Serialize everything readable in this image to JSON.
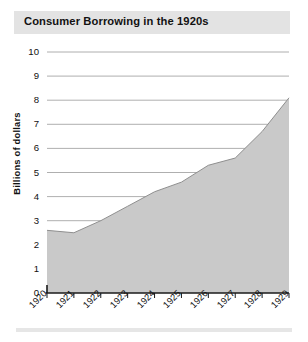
{
  "figure": {
    "title": "Consumer Borrowing in the 1920s",
    "bottom_rule": "",
    "colors": {
      "title_band": "#e3e3e3",
      "area_fill": "#c9c9c9",
      "area_line": "#8f8f8f",
      "gridline": "#9a9a9a",
      "axis": "#1a1a1a",
      "text": "#111111",
      "bottom_rule": "#e6e6e6"
    }
  },
  "chart_data": {
    "type": "area",
    "title": "Consumer Borrowing in the 1920s",
    "xlabel": "",
    "ylabel": "Billions of dollars",
    "categories": [
      "1920",
      "1921",
      "1922",
      "1923",
      "1924",
      "1925",
      "1926",
      "1927",
      "1928",
      "1929"
    ],
    "x": [
      1920,
      1921,
      1922,
      1923,
      1924,
      1925,
      1926,
      1927,
      1928,
      1929
    ],
    "values": [
      2.6,
      2.5,
      3.0,
      3.6,
      4.2,
      4.6,
      5.3,
      5.6,
      6.7,
      8.1
    ],
    "ylim": [
      0,
      10
    ],
    "xlim": [
      1920,
      1929
    ],
    "yticks": [
      0,
      1,
      2,
      3,
      4,
      5,
      6,
      7,
      8,
      9,
      10
    ],
    "ytick_labels": [
      "0",
      "1",
      "2",
      "3",
      "4",
      "5",
      "6",
      "7",
      "8",
      "9",
      "10"
    ],
    "xtick_labels": [
      "1920",
      "1921",
      "1922",
      "1923",
      "1924",
      "1925",
      "1926",
      "1927",
      "1928",
      "1929"
    ],
    "grid": true,
    "grid_axis": "y",
    "legend": false,
    "legend_position": "none",
    "series": [
      {
        "name": "Consumer borrowing",
        "values": [
          2.6,
          2.5,
          3.0,
          3.6,
          4.2,
          4.6,
          5.3,
          5.6,
          6.7,
          8.1
        ]
      }
    ]
  }
}
